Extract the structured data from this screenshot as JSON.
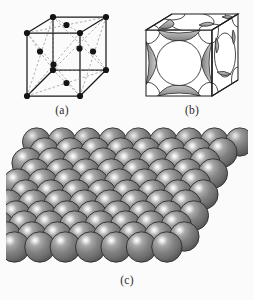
{
  "figure": {
    "background_color": "#fbfbfb",
    "panels": [
      {
        "id": "a",
        "caption": "(a)",
        "description": "Hard sphere reduced-sphere unit cell: cubic outline with atom points at the 8 corners and 6 face centers, dashed face diagonals",
        "line_color": "#1a1a1a",
        "dash_color": "#8a8a8a",
        "atom_color": "#141414",
        "atom_count_corners": 8,
        "atom_count_face_centers": 6
      },
      {
        "id": "b",
        "caption": "(b)",
        "description": "Hard sphere unit cell: spheres truncated by the cube faces, showing large face-centred circles and corner octants with shaded cut surfaces",
        "line_color": "#1f1f1f",
        "fill_color": "#ffffff",
        "shade_color": "#9a9a9a"
      },
      {
        "id": "c",
        "caption": "(c)",
        "description": "Aggregate of many close-packed atoms shown as shaded grey spheres stacked in the FCC arrangement",
        "sphere_color": "#808080",
        "sphere_highlight": "#f2f2f2",
        "sphere_edge": "#2d2d2d",
        "rows": 6,
        "columns": 6,
        "layers": 3
      }
    ]
  },
  "chart_data": {
    "type": "diagram",
    "panels": [
      "(a)",
      "(b)",
      "(c)"
    ]
  }
}
